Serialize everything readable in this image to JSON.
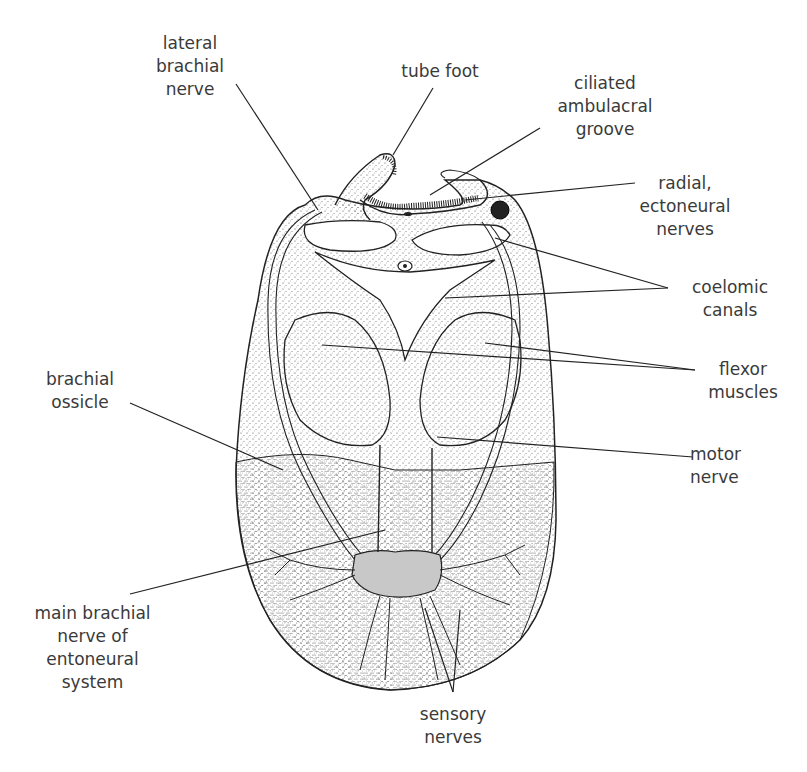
{
  "figure": {
    "colors": {
      "line": "#222222",
      "stipple": "#555555",
      "nerve_fill": "#c8c8c8",
      "background": "#ffffff"
    }
  },
  "labels": {
    "lateral_brachial_nerve": "lateral\nbrachial\nnerve",
    "tube_foot": "tube foot",
    "ciliated_ambulacral_groove": "ciliated\nambulacral\ngroove",
    "radial_ectoneural_nerves": "radial,\nectoneural\nnerves",
    "coelomic_canals": "coelomic\ncanals",
    "flexor_muscles": "flexor\nmuscles",
    "brachial_ossicle": "brachial\nossicle",
    "motor_nerve": "motor\nnerve",
    "main_brachial_nerve": "main brachial\nnerve of\nentoneural\nsystem",
    "sensory_nerves": "sensory\nnerves"
  }
}
